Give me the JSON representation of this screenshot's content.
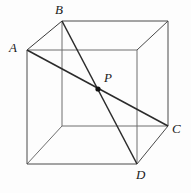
{
  "figure": {
    "type": "geometry-diagram",
    "width": 191,
    "height": 193,
    "background_color": "#fdfdfd",
    "stroke_color": "#2b2b2b",
    "hidden_stroke_color": "#8a8a8a",
    "labels": {
      "A": "A",
      "B": "B",
      "C": "C",
      "D": "D",
      "P": "P"
    },
    "points": {
      "A": {
        "x": 27,
        "y": 50
      },
      "B": {
        "x": 62,
        "y": 21
      },
      "C": {
        "x": 168,
        "y": 126
      },
      "D": {
        "x": 137,
        "y": 164
      },
      "P": {
        "x": 98,
        "y": 89
      }
    },
    "cube": {
      "front_face": [
        {
          "x": 27,
          "y": 50
        },
        {
          "x": 137,
          "y": 50
        },
        {
          "x": 137,
          "y": 164
        },
        {
          "x": 27,
          "y": 164
        }
      ],
      "back_face": [
        {
          "x": 62,
          "y": 21
        },
        {
          "x": 168,
          "y": 21
        },
        {
          "x": 168,
          "y": 126
        },
        {
          "x": 62,
          "y": 126
        }
      ],
      "connectors": [
        [
          {
            "x": 27,
            "y": 50
          },
          {
            "x": 62,
            "y": 21
          }
        ],
        [
          {
            "x": 137,
            "y": 50
          },
          {
            "x": 168,
            "y": 21
          }
        ],
        [
          {
            "x": 137,
            "y": 164
          },
          {
            "x": 168,
            "y": 126
          }
        ],
        [
          {
            "x": 27,
            "y": 164
          },
          {
            "x": 62,
            "y": 126
          }
        ]
      ]
    },
    "diagonals": [
      {
        "name": "diagonal-AC",
        "from": "A",
        "to": "C"
      },
      {
        "name": "diagonal-BD",
        "from": "B",
        "to": "D"
      }
    ]
  }
}
